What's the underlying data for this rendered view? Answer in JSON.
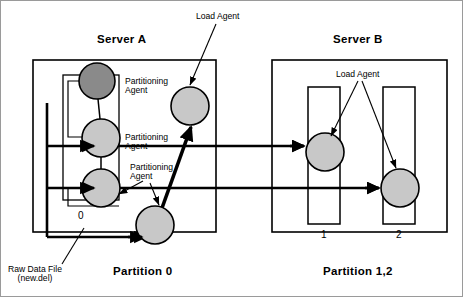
{
  "diagram": {
    "title_server_a": "Server A",
    "title_server_b": "Server B",
    "caption_partition_0": "Partition 0",
    "caption_partition_12": "Partition 1,2",
    "label_load_agent_top": "Load Agent",
    "label_load_agent_b": "Load Agent",
    "label_partitioning_agent_1": "Partitioning\nAgent",
    "label_partitioning_agent_2": "Partitioning\nAgent",
    "label_partitioning_agent_3": "Partitioning\nAgent",
    "label_raw_data_file": "Raw Data File\n(new.del)",
    "label_partition_num_0": "0",
    "label_partition_num_1": "1",
    "label_partition_num_2": "2",
    "colors": {
      "stroke": "#000000",
      "frame": "#9a9a9a",
      "node_light": "#c8c8c8",
      "node_dark": "#8a8a8a",
      "background": "#ffffff"
    }
  },
  "nodes": [
    {
      "id": "partitioning-agent-dark",
      "label": "Partitioning Agent",
      "cx": 97,
      "cy": 81,
      "r": 18,
      "fill": "#8a8a8a"
    },
    {
      "id": "partitioning-agent-mid",
      "label": "Partitioning Agent",
      "cx": 101,
      "cy": 138,
      "r": 19,
      "fill": "#c8c8c8"
    },
    {
      "id": "partitioning-agent-low",
      "label": "Partitioning Agent",
      "cx": 101,
      "cy": 188,
      "r": 19,
      "fill": "#c8c8c8"
    },
    {
      "id": "partitioning-agent-out",
      "label": "Partitioning Agent",
      "cx": 155,
      "cy": 225,
      "r": 19,
      "fill": "#c8c8c8"
    },
    {
      "id": "load-agent-a",
      "label": "Load Agent",
      "cx": 190,
      "cy": 106,
      "r": 19,
      "fill": "#c8c8c8"
    },
    {
      "id": "load-agent-b1",
      "label": "Load Agent",
      "cx": 325,
      "cy": 152,
      "r": 19,
      "fill": "#c8c8c8"
    },
    {
      "id": "load-agent-b2",
      "label": "Load Agent",
      "cx": 400,
      "cy": 188,
      "r": 19,
      "fill": "#c8c8c8"
    }
  ],
  "containers": [
    {
      "id": "server-a-box",
      "x": 33,
      "y": 60,
      "w": 183,
      "h": 172
    },
    {
      "id": "server-b-box",
      "x": 272,
      "y": 60,
      "w": 175,
      "h": 172
    },
    {
      "id": "partition-0-box",
      "x": 63,
      "y": 75,
      "w": 56,
      "h": 125
    },
    {
      "id": "partition-1-box",
      "x": 308,
      "y": 87,
      "w": 32,
      "h": 137
    },
    {
      "id": "partition-2-box",
      "x": 383,
      "y": 87,
      "w": 32,
      "h": 137
    }
  ]
}
